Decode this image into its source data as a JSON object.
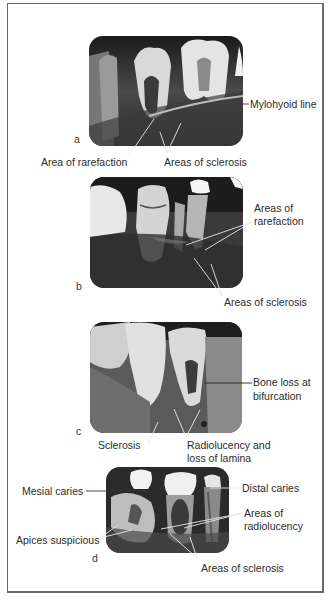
{
  "figure": {
    "panels": [
      {
        "letter": "a",
        "labels": {
          "mylohyoid_line": "Mylohyoid line",
          "area_of_rarefaction": "Area of rarefaction",
          "areas_of_sclerosis": "Areas of sclerosis"
        }
      },
      {
        "letter": "b",
        "labels": {
          "areas_of_rarefaction_line1": "Areas of",
          "areas_of_rarefaction_line2": "rarefaction",
          "areas_of_sclerosis": "Areas of sclerosis"
        }
      },
      {
        "letter": "c",
        "labels": {
          "bone_loss_line1": "Bone loss at",
          "bone_loss_line2": "bifurcation",
          "sclerosis": "Sclerosis",
          "radiolucency_line1": "Radiolucency and",
          "radiolucency_line2": "loss of lamina"
        }
      },
      {
        "letter": "d",
        "labels": {
          "mesial_caries": "Mesial caries",
          "distal_caries": "Distal caries",
          "areas_of_radiolucency_line1": "Areas of",
          "areas_of_radiolucency_line2": "radiolucency",
          "apices_suspicious": "Apices suspicious",
          "areas_of_sclerosis": "Areas of sclerosis"
        }
      }
    ],
    "colors": {
      "frame_border": "#6a6a6a",
      "label_text": "#2b2b2b",
      "leader_line_on_dark": "#e8e8e8",
      "leader_line_on_light": "#333333"
    }
  }
}
